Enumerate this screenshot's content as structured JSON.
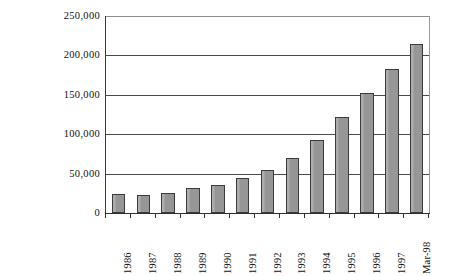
{
  "chart_data": {
    "type": "bar",
    "title": "",
    "subtitle": "",
    "xlabel": "",
    "ylabel": "Employment",
    "categories": [
      "1986",
      "1987",
      "1988",
      "1989",
      "1990",
      "1991",
      "1992",
      "1993",
      "1994",
      "1995",
      "1996",
      "1997",
      "Mar-98"
    ],
    "values": [
      24000,
      23000,
      26000,
      32000,
      35000,
      45000,
      54000,
      70000,
      93000,
      122000,
      152000,
      183000,
      215000
    ],
    "series": [
      {
        "name": "Employment",
        "values": [
          24000,
          23000,
          26000,
          32000,
          35000,
          45000,
          54000,
          70000,
          93000,
          122000,
          152000,
          183000,
          215000
        ]
      }
    ],
    "ylim": [
      0,
      250000
    ],
    "ytick_values": [
      0,
      50000,
      100000,
      150000,
      200000,
      250000
    ],
    "ytick_labels": [
      "0",
      "50,000",
      "100,000",
      "150,000",
      "200,000",
      "250,000"
    ],
    "grid": true,
    "grid_axis": "y",
    "legend": false,
    "legend_position": "none",
    "bar_color": "#969696",
    "bar_border_color": "#3b3b3b",
    "gridline_color": "#4a4a4a",
    "axis_color": "#2f2f2f",
    "background_color": "#ffffff",
    "text_color": "#111111"
  }
}
